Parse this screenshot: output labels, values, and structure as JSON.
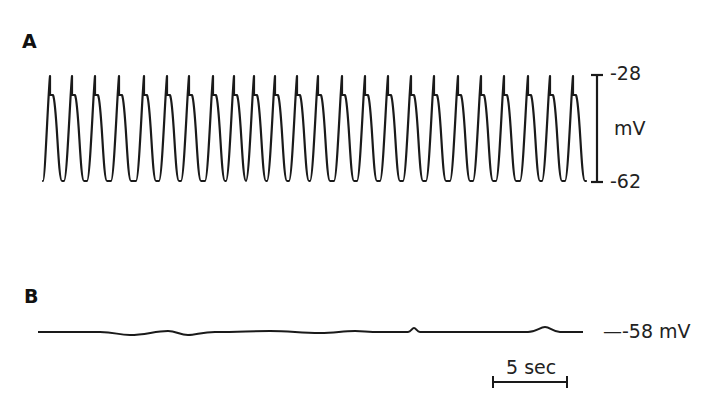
{
  "panels": {
    "a": {
      "label": "A"
    },
    "b": {
      "label": "B"
    }
  },
  "scale_a": {
    "top": "-28",
    "unit": "mV",
    "bottom": "-62"
  },
  "scale_b": {
    "level": "—-58 mV"
  },
  "time_scale": {
    "label": "5 sec"
  },
  "colors": {
    "trace": "#1a1a1a",
    "background": "#ffffff"
  },
  "chart_data": [
    {
      "type": "line",
      "title": "A",
      "description": "Regular oscillating membrane potential (pacemaker-like action potentials), each with a brief spike followed by plateau shoulder and repolarization",
      "ylabel": "mV",
      "ylim": [
        -62,
        -28
      ],
      "y_ticks": [
        "-28",
        "-62"
      ],
      "cycles": 24,
      "period_sec_approx": 1.53,
      "peak_mV": -28,
      "shoulder_mV_approx": -33,
      "trough_mV": -62,
      "spike_x_px": [
        50,
        72,
        95,
        119,
        144,
        167,
        189,
        213,
        234,
        254,
        275,
        297,
        318,
        342,
        365,
        388,
        411,
        434,
        458,
        481,
        504,
        528,
        550,
        573
      ]
    },
    {
      "type": "line",
      "title": "B",
      "description": "Flat resting membrane potential with minor fluctuations, no oscillations",
      "ylabel": "mV",
      "level_mV": -58,
      "level_label": "-58 mV",
      "features": [
        {
          "x_px": 128,
          "kind": "dip"
        },
        {
          "x_px": 170,
          "kind": "bump"
        },
        {
          "x_px": 188,
          "kind": "dip"
        },
        {
          "x_px": 270,
          "kind": "bump"
        },
        {
          "x_px": 355,
          "kind": "bump"
        },
        {
          "x_px": 414,
          "kind": "small spike"
        },
        {
          "x_px": 545,
          "kind": "bump"
        }
      ]
    }
  ],
  "time_bar": {
    "seconds": 5,
    "x_start_px": 493,
    "x_end_px": 567
  }
}
